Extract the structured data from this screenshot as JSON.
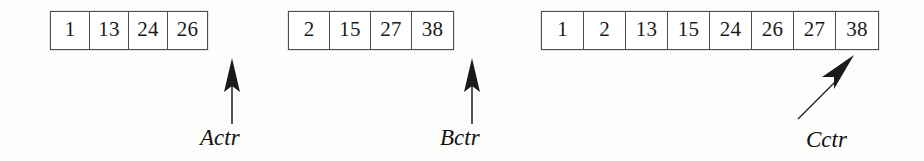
{
  "figure": {
    "background_color": "#fdfdfb",
    "line_color": "#4e4e4e",
    "text_color": "#1a1a1a"
  },
  "arrays": [
    {
      "id": "array-a",
      "values": [
        "1",
        "13",
        "24",
        "26"
      ]
    },
    {
      "id": "array-b",
      "values": [
        "2",
        "15",
        "27",
        "38"
      ]
    },
    {
      "id": "array-c",
      "values": [
        "1",
        "2",
        "13",
        "15",
        "24",
        "26",
        "27",
        "38"
      ]
    }
  ],
  "pointers": [
    {
      "id": "pointer-a",
      "label": "Actr",
      "direction": "up"
    },
    {
      "id": "pointer-b",
      "label": "Bctr",
      "direction": "up"
    },
    {
      "id": "pointer-c",
      "label": "Cctr",
      "direction": "up-right"
    }
  ]
}
